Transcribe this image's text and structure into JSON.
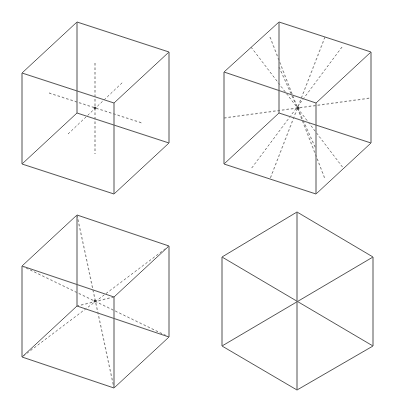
{
  "figure": {
    "panels": [
      {
        "id": "cube-face-axes",
        "description": "Cube with three dashed axes through centre, parallel to edges"
      },
      {
        "id": "cube-edge-axes",
        "description": "Cube with dashed axes joining midpoints of opposite edges"
      },
      {
        "id": "cube-diagonal-axes",
        "description": "Cube with dashed space diagonals joining opposite vertices"
      },
      {
        "id": "cube-hexagon-view",
        "description": "Cube viewed along a space diagonal, appearing as a hexagon"
      }
    ],
    "colors": {
      "edge": "#555555",
      "dash": "#666666",
      "background": "#ffffff"
    }
  }
}
